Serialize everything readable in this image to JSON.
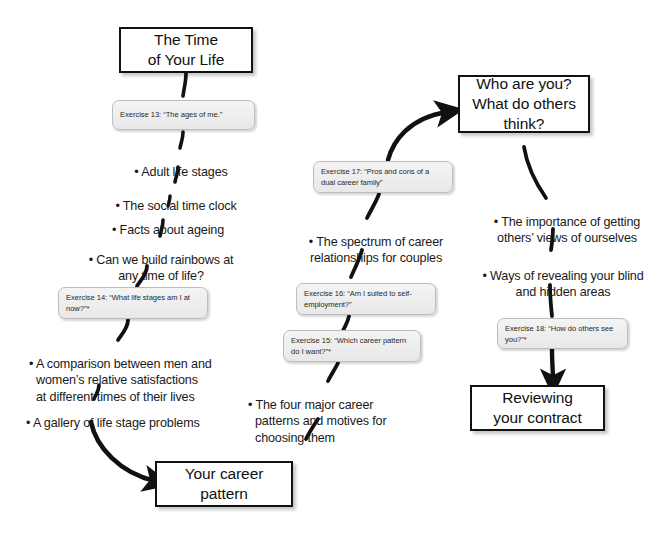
{
  "diagram": {
    "background_color": "#ffffff",
    "stage_box_border_color": "#111111",
    "exercise_box_fill": "#eeeeee",
    "connector_color": "#111111"
  },
  "stages": {
    "time_of_your_life": "The Time\nof Your Life",
    "your_career_pattern": "Your career\npattern",
    "who_are_you": "Who are you?\nWhat do others\nthink?",
    "reviewing_your_contract": "Reviewing\nyour contract"
  },
  "exercises": [
    {
      "id": "ex13",
      "label": "Exercise 13: “The ages of me.”"
    },
    {
      "id": "ex14",
      "label": "Exercise 14: “What life stages am I at now?”*"
    },
    {
      "id": "ex17",
      "label": "Exercise 17: “Pros and cons of a dual career family”"
    },
    {
      "id": "ex16",
      "label": "Exercise 16: “Am I suited to self-employment?”"
    },
    {
      "id": "ex15",
      "label": "Exercise 15: “Which career pattern do I want?”*"
    },
    {
      "id": "ex18",
      "label": "Exercise 18: “How do others see you?”*"
    }
  ],
  "topics": {
    "left_column": [
      {
        "id": "t1",
        "text": "• Adult life stages"
      },
      {
        "id": "t2",
        "text": "• The social time clock"
      },
      {
        "id": "t3",
        "text": "• Facts about ageing"
      },
      {
        "id": "t4",
        "text": "• Can we build rainbows at\nany time of life?"
      },
      {
        "id": "t5",
        "text": "• A comparison between men and\nwomen’s relative satisfactions\nat different times of their lives"
      },
      {
        "id": "t6",
        "text": "• A gallery of life stage problems"
      }
    ],
    "middle_column": [
      {
        "id": "m1",
        "text": "• The spectrum of career\nrelationships for couples"
      },
      {
        "id": "m2",
        "text": "• The four major career\npatterns and motives for\nchoosing them"
      }
    ],
    "right_column": [
      {
        "id": "r1",
        "text": "• The importance of getting\nothers’ views of ourselves"
      },
      {
        "id": "r2",
        "text": "• Ways of revealing your blind\nand hidden areas"
      }
    ]
  }
}
